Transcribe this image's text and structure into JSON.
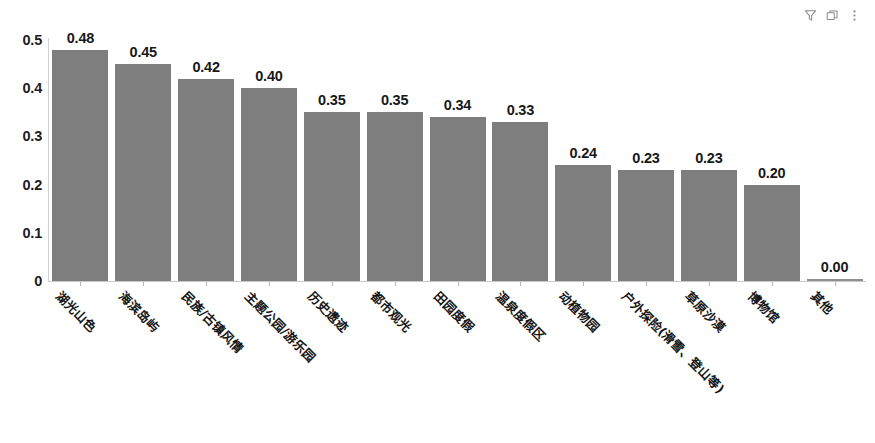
{
  "toolbar": {
    "filter_icon": "filter-icon",
    "copy_icon": "copy-icon",
    "more_icon": "more-vertical-icon"
  },
  "chart_data": {
    "type": "bar",
    "title": "",
    "xlabel": "",
    "ylabel": "",
    "ylim": [
      0,
      0.5
    ],
    "grid": false,
    "legend": "none",
    "bar_color": "#7e7e7e",
    "yticks": [
      "0",
      "0.1",
      "0.2",
      "0.3",
      "0.4",
      "0.5"
    ],
    "ytick_values": [
      0,
      0.1,
      0.2,
      0.3,
      0.4,
      0.5
    ],
    "categories": [
      "湖光山色",
      "海滨岛屿",
      "民族/古镇风情",
      "主题公园/游乐园",
      "历史遗迹",
      "都市观光",
      "田园度假",
      "温泉度假区",
      "动植物园",
      "户外探险(滑雪、登山等)",
      "草原沙漠",
      "博物馆",
      "其他"
    ],
    "values": [
      0.48,
      0.45,
      0.42,
      0.4,
      0.35,
      0.35,
      0.34,
      0.33,
      0.24,
      0.23,
      0.23,
      0.2,
      0.0
    ],
    "data_labels": [
      "0.48",
      "0.45",
      "0.42",
      "0.40",
      "0.35",
      "0.35",
      "0.34",
      "0.33",
      "0.24",
      "0.23",
      "0.23",
      "0.20",
      "0.00"
    ]
  }
}
